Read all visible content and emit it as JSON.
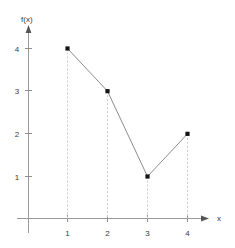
{
  "chart_data": {
    "type": "line",
    "title": "",
    "subtitle": "",
    "xlabel": "x",
    "ylabel": "f(x)",
    "x": [
      1,
      2,
      3,
      4
    ],
    "values": [
      4,
      3,
      1,
      2
    ],
    "categories": [
      "1",
      "2",
      "3",
      "4"
    ],
    "series": [
      {
        "name": "f(x)",
        "values": [
          4,
          3,
          1,
          2
        ]
      }
    ],
    "points": [
      {
        "x": 1,
        "y": 4
      },
      {
        "x": 2,
        "y": 3
      },
      {
        "x": 3,
        "y": 1
      },
      {
        "x": 4,
        "y": 2
      }
    ],
    "xlim": [
      0,
      4.6
    ],
    "ylim": [
      0,
      4.6
    ],
    "xticks": [
      1,
      2,
      3,
      4
    ],
    "yticks": [
      1,
      2,
      3,
      4
    ],
    "xtick_labels": [
      "1",
      "2",
      "3",
      "4"
    ],
    "ytick_labels": [
      "1",
      "2",
      "3",
      "4"
    ],
    "grid": false,
    "legend": false,
    "legend_position": "none",
    "markers": "square",
    "drop_lines": true,
    "annotations": [],
    "colors": {
      "background": "#ffffff",
      "axis": "#9a9a9a",
      "line": "#8c8c8c",
      "marker": "#151515",
      "drop_line": "#cccccc",
      "text": "#3a3a3a"
    }
  },
  "axes": {
    "y_label": "f(x)",
    "x_label": "x",
    "y_ticks": [
      {
        "label": "4",
        "value": 4
      },
      {
        "label": "3",
        "value": 3
      },
      {
        "label": "2",
        "value": 2
      },
      {
        "label": "1",
        "value": 1
      }
    ],
    "x_ticks": [
      {
        "label": "1",
        "value": 1
      },
      {
        "label": "2",
        "value": 2
      },
      {
        "label": "3",
        "value": 3
      },
      {
        "label": "4",
        "value": 4
      }
    ]
  }
}
